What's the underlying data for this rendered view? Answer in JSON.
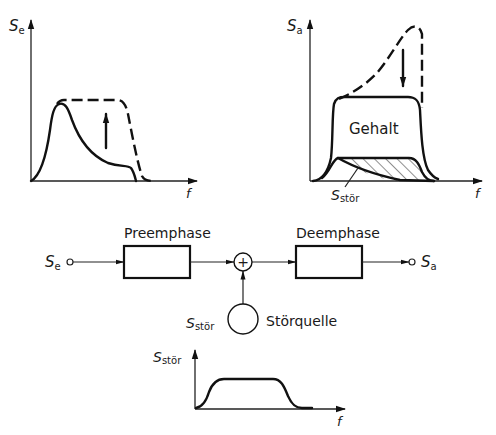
{
  "charts": {
    "input_spectrum": {
      "y_label": "S",
      "y_label_sub": "e",
      "x_label": "f",
      "solid_curve": "original signal spectrum",
      "dashed_curve": "pre-emphasized spectrum",
      "arrow_direction": "up"
    },
    "output_spectrum": {
      "y_label": "S",
      "y_label_sub": "a",
      "x_label": "f",
      "content_label": "Gehalt",
      "noise_label": "S",
      "noise_label_sub": "stör",
      "arrow_direction": "down"
    },
    "noise_spectrum": {
      "y_label": "S",
      "y_label_sub": "stör",
      "x_label": "f"
    }
  },
  "block_diagram": {
    "input_label": "S",
    "input_sub": "e",
    "output_label": "S",
    "output_sub": "a",
    "preemphase_label": "Preemphase",
    "deemphase_label": "Deemphase",
    "summer_symbol": "+",
    "noise_source_label": "Störquelle",
    "noise_signal_label": "S",
    "noise_signal_sub": "stör"
  },
  "colors": {
    "stroke": "#111111",
    "background": "#ffffff"
  }
}
